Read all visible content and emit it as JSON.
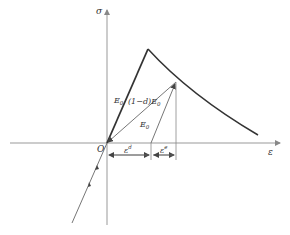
{
  "diagram": {
    "axes": {
      "y_label": "σ",
      "x_label": "ε",
      "origin_label": "O"
    },
    "labels": {
      "elastic_modulus_loading": "E",
      "elastic_modulus_loading_sub": "0",
      "damaged_modulus_prefix": "(1−d)E",
      "damaged_modulus_sub": "0",
      "unloading_modulus": "E",
      "unloading_modulus_sub": "0",
      "damage_strain": "ε",
      "damage_strain_sup": "d",
      "elastic_strain": "ε",
      "elastic_strain_sup": "e"
    },
    "colors": {
      "line": "#555555",
      "curve": "#333333",
      "axis": "#999999"
    }
  }
}
